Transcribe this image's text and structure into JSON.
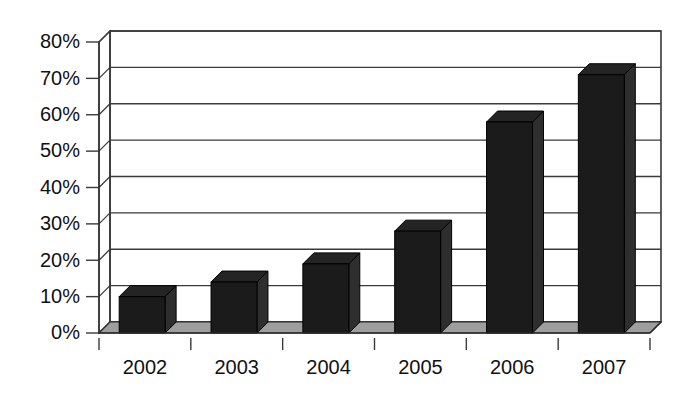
{
  "chart_data": {
    "type": "bar",
    "title": "",
    "subtitle": "",
    "xlabel": "",
    "ylabel": "",
    "categories": [
      "2002",
      "2003",
      "2004",
      "2005",
      "2006",
      "2007"
    ],
    "values": [
      10,
      14,
      19,
      28,
      58,
      71
    ],
    "value_format": "percent",
    "ylim": [
      0,
      80
    ],
    "ytick_values": [
      0,
      10,
      20,
      30,
      40,
      50,
      60,
      70,
      80
    ],
    "ytick_labels": [
      "0%",
      "10%",
      "20%",
      "30%",
      "40%",
      "50%",
      "60%",
      "70%",
      "80%"
    ],
    "grid": true,
    "grid_axis": "y",
    "legend": false,
    "legend_position": "none",
    "style": "3d-column",
    "colors": {
      "bar_front": "#1b1b1b",
      "bar_side": "#2e2e2e",
      "bar_top": "#242424",
      "floor": "#9e9e9e",
      "wall": "#ffffff",
      "gridline": "#3a3a3a",
      "text": "#111111"
    }
  }
}
